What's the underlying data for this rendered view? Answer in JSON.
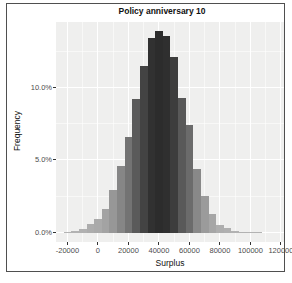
{
  "window": {
    "frame_color": "#4f4f4f",
    "background": "#ffffff"
  },
  "chart_data": {
    "type": "bar",
    "subtype": "histogram",
    "title": "Policy anniversary 10",
    "xlabel": "Surplus",
    "ylabel": "Frequency",
    "x_tick_values": [
      -20000,
      0,
      20000,
      40000,
      60000,
      80000,
      100000,
      120000
    ],
    "x_tick_labels": [
      "-20000",
      "0",
      "20000",
      "40000",
      "60000",
      "80000",
      "100000",
      "120000"
    ],
    "y_tick_values": [
      0,
      5,
      10
    ],
    "y_tick_labels": [
      "0.0%",
      "5.0%",
      "10.0%"
    ],
    "x_minor_tick_values": [
      -10000,
      10000,
      30000,
      50000,
      70000,
      90000,
      110000
    ],
    "y_minor_tick_values": [
      2.5,
      7.5,
      12.5
    ],
    "bin_width": 5000,
    "bin_centers": [
      -20000,
      -15000,
      -10000,
      -5000,
      0,
      5000,
      10000,
      15000,
      20000,
      25000,
      30000,
      35000,
      40000,
      45000,
      50000,
      55000,
      60000,
      65000,
      70000,
      75000,
      80000,
      85000,
      90000,
      95000,
      100000,
      105000
    ],
    "bin_heights_pct": [
      0.03,
      0.1,
      0.25,
      0.6,
      0.9,
      1.65,
      2.9,
      4.6,
      6.6,
      9.2,
      11.5,
      13.4,
      13.9,
      13.55,
      12.1,
      9.3,
      7.4,
      4.4,
      2.5,
      1.3,
      0.55,
      0.3,
      0.12,
      0.06,
      0.04,
      0.02
    ],
    "xlim": [
      -27500,
      122000
    ],
    "ylim_pct": [
      -0.65,
      14.5
    ],
    "grid": "white major and minor gridlines on light grey panel",
    "legend": "none",
    "panel_bg": "#efefee",
    "grid_color": "#ffffff",
    "bar_color_low": "#b3b3b3",
    "bar_color_high": "#2c2c2c",
    "tick_label_color": "#4d4d4d",
    "text_color": "#111111"
  }
}
